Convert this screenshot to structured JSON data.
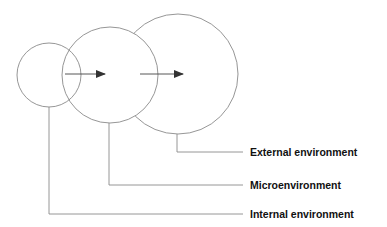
{
  "diagram": {
    "type": "nested-environments",
    "labels": [
      {
        "id": "external",
        "text": "External environment"
      },
      {
        "id": "micro",
        "text": "Microenvironment"
      },
      {
        "id": "internal",
        "text": "Internal environment"
      }
    ],
    "colors": {
      "stroke": "#8a8a8a",
      "arrow": "#333333",
      "text": "#111111"
    }
  }
}
